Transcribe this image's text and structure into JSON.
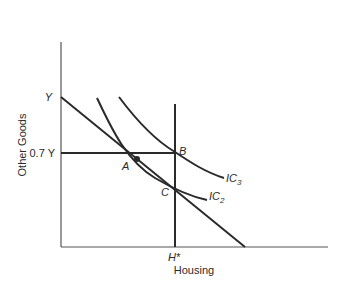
{
  "diagram": {
    "type": "economics-indifference-curves",
    "axes": {
      "ylabel": "Other Goods",
      "xlabel": "Housing",
      "y_ticks": [
        "Y",
        "0.7 Y"
      ],
      "x_ticks": [
        "H*"
      ]
    },
    "points": {
      "A": "A",
      "B": "B",
      "C": "C"
    },
    "curves": {
      "ic2_main": "IC",
      "ic2_sub": "2",
      "ic3_main": "IC",
      "ic3_sub": "3"
    },
    "colors": {
      "line": "#2a2a2a",
      "background": "#ffffff"
    }
  }
}
